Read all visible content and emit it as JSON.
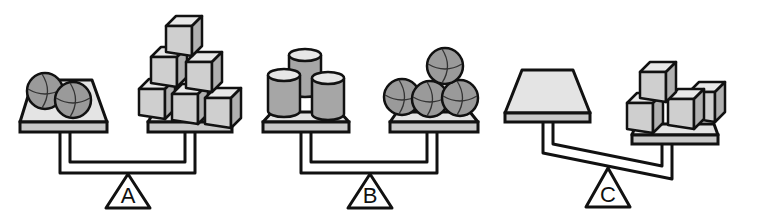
{
  "colors": {
    "outline": "#111111",
    "pan_top": "#e4e4e4",
    "pan_edge": "#c8c8c8",
    "sphere": "#9a9a9a",
    "cube_top": "#e8e8e8",
    "cube_front": "#cfcfcf",
    "cube_side": "#b0b0b0",
    "cylinder_top": "#e6e6e6",
    "cylinder_body": "#a6a6a6",
    "background": "#ffffff"
  },
  "scales": [
    {
      "label": "A",
      "state": "balanced",
      "left_pan": {
        "object": "sphere",
        "count": 2
      },
      "right_pan": {
        "object": "cube",
        "count": 6
      }
    },
    {
      "label": "B",
      "state": "balanced",
      "left_pan": {
        "object": "cylinder",
        "count": 3
      },
      "right_pan": {
        "object": "sphere",
        "count": 4
      }
    },
    {
      "label": "C",
      "state": "right-heavy",
      "left_pan": {
        "object": "empty",
        "count": 0
      },
      "right_pan": {
        "object": "cube",
        "count": 4
      }
    }
  ]
}
